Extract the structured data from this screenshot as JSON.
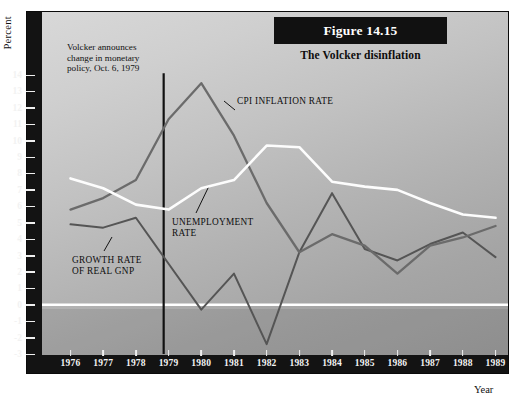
{
  "figure": {
    "number_label": "Figure 14.15",
    "subtitle": "The Volcker disinflation",
    "y_axis_title": "Percent",
    "x_axis_title": "Year"
  },
  "annotations": {
    "volcker_note_line1": "Volcker announces",
    "volcker_note_line2": "change in monetary",
    "volcker_note_line3": "policy, Oct. 6, 1979",
    "volcker_event_year": 1979,
    "cpi_label": "CPI INFLATION RATE",
    "unemployment_label_line1": "UNEMPLOYMENT",
    "unemployment_label_line2": "RATE",
    "gnp_label_line1": "GROWTH RATE",
    "gnp_label_line2": "OF REAL GNP"
  },
  "colors": {
    "panel_frame": "#131313",
    "plot_light": "#d8d8d8",
    "plot_dark": "#9a9a9a",
    "tick_text": "#f2f2f2",
    "cpi_line": "#6b6b6b",
    "unemployment_line": "#fdfdfd",
    "gnp_line": "#555555",
    "zero_line": "#ffffff",
    "event_line": "#111111"
  },
  "chart_data": {
    "type": "line",
    "title": "Figure 14.15",
    "subtitle": "The Volcker disinflation",
    "xlabel": "Year",
    "ylabel": "Percent",
    "grid": false,
    "legend": "inline-annotations",
    "xlim": [
      1976,
      1989
    ],
    "ylim": [
      -3,
      14
    ],
    "ytick_values": [
      14,
      13,
      12,
      11,
      10,
      9,
      8,
      7,
      6,
      5,
      4,
      3,
      2,
      1,
      0,
      -1,
      -2,
      -3
    ],
    "ytick_labels": [
      "14",
      "13",
      "12",
      "11",
      "10",
      "9",
      "8",
      "7",
      "6",
      "5",
      "4",
      "3",
      "2",
      "1",
      "0",
      "-1",
      "-2",
      "-3"
    ],
    "x": [
      1976,
      1977,
      1978,
      1979,
      1980,
      1981,
      1982,
      1983,
      1984,
      1985,
      1986,
      1987,
      1988,
      1989
    ],
    "xtick_labels": [
      "1976",
      "1977",
      "1978",
      "1979",
      "1980",
      "1981",
      "1982",
      "1983",
      "1984",
      "1985",
      "1986",
      "1987",
      "1988",
      "1989"
    ],
    "series": [
      {
        "name": "CPI INFLATION RATE",
        "color": "#6b6b6b",
        "values": [
          5.8,
          6.5,
          7.6,
          11.3,
          13.5,
          10.3,
          6.2,
          3.2,
          4.3,
          3.6,
          1.9,
          3.6,
          4.1,
          4.8
        ]
      },
      {
        "name": "UNEMPLOYMENT RATE",
        "color": "#fdfdfd",
        "values": [
          7.7,
          7.1,
          6.1,
          5.8,
          7.1,
          7.6,
          9.7,
          9.6,
          7.5,
          7.2,
          7.0,
          6.2,
          5.5,
          5.3
        ]
      },
      {
        "name": "GROWTH RATE OF REAL GNP",
        "color": "#555555",
        "values": [
          4.9,
          4.7,
          5.3,
          2.5,
          -0.3,
          1.9,
          -2.4,
          3.2,
          6.8,
          3.4,
          2.7,
          3.7,
          4.4,
          2.9
        ]
      }
    ],
    "event_marker": {
      "label": "Volcker announces change in monetary policy, Oct. 6, 1979",
      "x": 1978.85
    }
  }
}
